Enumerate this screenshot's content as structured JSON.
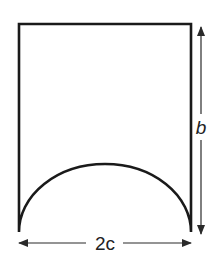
{
  "diagram": {
    "title": "",
    "shape": "rectangle-with-semielliptical-arch-cutout",
    "labels": {
      "height": "b",
      "width": "2c"
    },
    "colors": {
      "stroke": "#1a1a1a",
      "dimension_line": "#2a2a2a",
      "text": "#222222",
      "background": "#ffffff"
    }
  }
}
